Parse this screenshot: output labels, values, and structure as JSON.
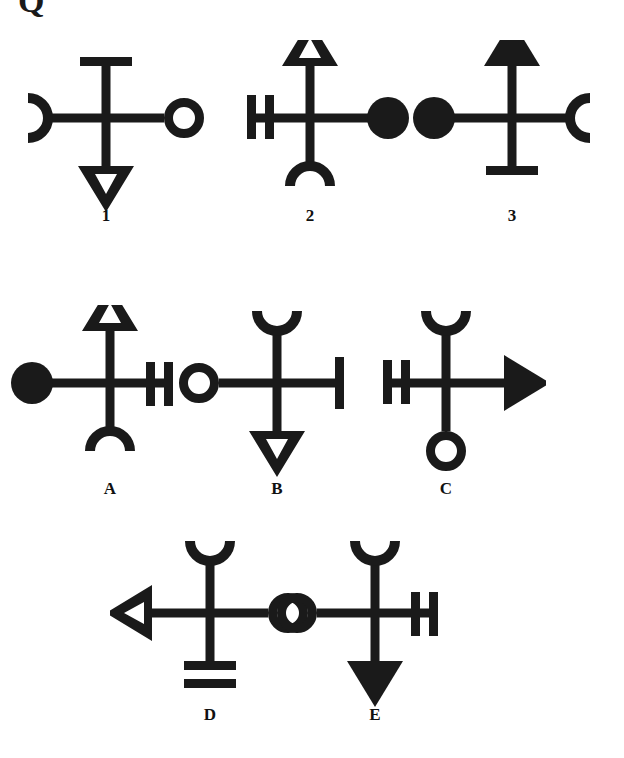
{
  "page": {
    "background_color": "#ffffff",
    "ink_color": "#1a1a1a",
    "corner_mark": "Q",
    "width": 624,
    "height": 758
  },
  "puzzle": {
    "type": "abstract-reasoning-symbol-series",
    "prompt_row_label": "sequence",
    "option_row_label": "answer-options",
    "terminal_types": {
      "bar": "single perpendicular bar (T-end)",
      "double-bar": "two parallel perpendicular bars",
      "double-bar-stacked": "two stacked horizontal bars",
      "ring": "open circle outline",
      "disc": "filled solid circle",
      "triangle-open": "hollow triangle arrowhead",
      "triangle-filled": "solid triangle arrowhead",
      "arc-open": "open semicircular arc / half ring"
    }
  },
  "figures": {
    "sequence": [
      {
        "label": "1",
        "x": 106,
        "y": 40,
        "label_y": 207,
        "ends": {
          "up": "bar",
          "down": "triangle-open",
          "left": "arc-open",
          "right": "ring"
        }
      },
      {
        "label": "2",
        "x": 310,
        "y": 40,
        "label_y": 207,
        "ends": {
          "up": "triangle-open",
          "down": "arc-open",
          "left": "double-bar",
          "right": "disc"
        }
      },
      {
        "label": "3",
        "x": 512,
        "y": 40,
        "label_y": 207,
        "ends": {
          "up": "triangle-filled",
          "down": "bar",
          "left": "disc",
          "right": "arc-open"
        }
      }
    ],
    "options": [
      {
        "label": "A",
        "x": 110,
        "y": 305,
        "label_y": 480,
        "ends": {
          "up": "triangle-open",
          "down": "arc-open",
          "left": "disc",
          "right": "double-bar"
        }
      },
      {
        "label": "B",
        "x": 277,
        "y": 305,
        "label_y": 480,
        "ends": {
          "up": "arc-open",
          "down": "triangle-open",
          "left": "ring",
          "right": "bar"
        }
      },
      {
        "label": "C",
        "x": 446,
        "y": 305,
        "label_y": 480,
        "ends": {
          "up": "arc-open",
          "down": "ring",
          "left": "double-bar",
          "right": "triangle-filled"
        }
      },
      {
        "label": "D",
        "x": 210,
        "y": 535,
        "label_y": 706,
        "ends": {
          "up": "arc-open",
          "down": "double-bar-stacked",
          "left": "triangle-open",
          "right": "ring"
        }
      },
      {
        "label": "E",
        "x": 375,
        "y": 535,
        "label_y": 706,
        "ends": {
          "up": "arc-open",
          "down": "triangle-filled",
          "left": "ring",
          "right": "double-bar"
        }
      }
    ]
  }
}
